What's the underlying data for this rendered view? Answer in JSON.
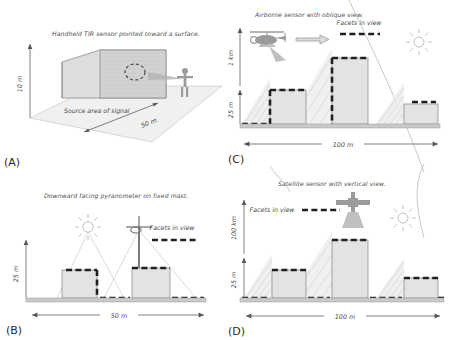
{
  "figure": {
    "width": 450,
    "height": 340,
    "style": "hand-drawn scientific schematic, grayscale"
  },
  "colors": {
    "facet": "#1f1f1f",
    "building_fill": "#e3e3e3",
    "building_stroke": "#8e8e8e",
    "ground": "#c9c9c9",
    "ray": "#bdbdbd",
    "text": "#4a4a4a"
  },
  "legend": {
    "label": "Facets in view",
    "swatch": "dashed-black-line"
  },
  "panels": [
    {
      "id": "A",
      "tag": "(A)",
      "title": "Handheld TIR sensor pointed toward a surface.",
      "view_type": "3d-oblique-block",
      "axes": {
        "vertical": "10 m",
        "horizontal": "50 m"
      },
      "annotation": "Source area of signal",
      "icons": [
        "person-icon",
        "sensor-cone-icon",
        "block-icon",
        "source-ellipse-icon"
      ]
    },
    {
      "id": "B",
      "tag": "(B)",
      "title": "Downward facing pyranometer on fixed mast.",
      "view_type": "profile",
      "axes": {
        "vertical": "25 m",
        "horizontal": "50 m"
      },
      "legend_label": "Facets in view",
      "icons": [
        "sun-icon",
        "pyranometer-mast-icon"
      ],
      "buildings": [
        {
          "x": 28,
          "width": 30,
          "height": 22
        },
        {
          "x": 82,
          "width": 32,
          "height": 24
        }
      ]
    },
    {
      "id": "C",
      "tag": "(C)",
      "title": "Airborne sensor with oblique view.",
      "view_type": "profile",
      "axes": {
        "vertical_upper": "1 km",
        "vertical_lower": "25 m",
        "horizontal": "100 m"
      },
      "legend_label": "Facets in view",
      "icons": [
        "helicopter-icon",
        "flight-arrow-icon",
        "view-cone-icon",
        "sun-icon"
      ],
      "buildings": [
        {
          "x": 30,
          "width": 26,
          "height": 25
        },
        {
          "x": 66,
          "width": 26,
          "height": 50
        },
        {
          "x": 120,
          "width": 26,
          "height": 16
        }
      ]
    },
    {
      "id": "D",
      "tag": "(D)",
      "title": "Satellite sensor with vertical view.",
      "view_type": "profile",
      "axes": {
        "vertical_upper": "100 km",
        "vertical_lower": "25 m",
        "horizontal": "100 m"
      },
      "legend_label": "Facets in view",
      "icons": [
        "satellite-icon",
        "view-cone-icon",
        "sun-icon",
        "swoosh-icon"
      ],
      "buildings": [
        {
          "x": 30,
          "width": 26,
          "height": 20
        },
        {
          "x": 66,
          "width": 26,
          "height": 45
        },
        {
          "x": 120,
          "width": 26,
          "height": 14
        }
      ]
    }
  ]
}
